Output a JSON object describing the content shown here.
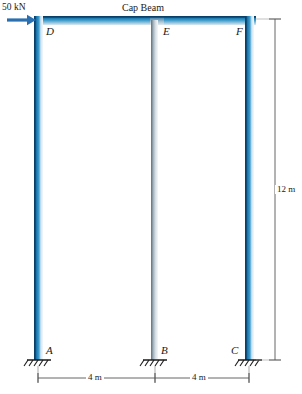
{
  "figure": {
    "title": "Cap Beam",
    "load_label": "50 kN",
    "joints": {
      "A": "A",
      "B": "B",
      "C": "C",
      "D": "D",
      "E": "E",
      "F": "F"
    },
    "dimensions": {
      "left_span": "4 m",
      "right_span": "4 m",
      "height": "12 m"
    },
    "icons": {
      "load_arrow": "arrow-right-icon",
      "support_a": "fixed-support-icon",
      "support_b": "fixed-support-icon",
      "support_c": "fixed-support-icon"
    },
    "colors": {
      "column_outer": "#1d6ea4",
      "column_outer_dark": "#0f4d78",
      "column_middle": "#9aa9b4",
      "column_middle_light": "#cdd6dd",
      "beam_top": "#0e5486",
      "beam_body": "#2f8fc4",
      "arrow": "#2a6fb0",
      "dimension_line": "#5a5a5a",
      "support_line": "#1a1a1a"
    }
  }
}
